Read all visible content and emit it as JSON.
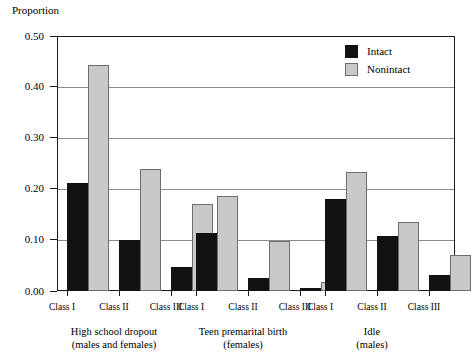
{
  "chart_data": {
    "type": "bar",
    "title": "",
    "xlabel": "",
    "ylabel": "Proportion",
    "ylim": [
      0.0,
      0.5
    ],
    "yticks": [
      "0.00",
      "0.10",
      "0.20",
      "0.30",
      "0.40",
      "0.50"
    ],
    "ytick_values": [
      0.0,
      0.1,
      0.2,
      0.3,
      0.4,
      0.5
    ],
    "grid": true,
    "legend_position": "top-right",
    "legend": [
      "Intact",
      "Nonintact"
    ],
    "categories": [
      "Class I",
      "Class II",
      "Class III"
    ],
    "groups": [
      {
        "caption_line1": "High school dropout",
        "caption_line2": "(males and females)",
        "categories": [
          "Class I",
          "Class II",
          "Class III"
        ],
        "series": [
          {
            "name": "Intact",
            "values": [
              0.211,
              0.101,
              0.048
            ]
          },
          {
            "name": "Nonintact",
            "values": [
              0.444,
              0.239,
              0.17
            ]
          }
        ]
      },
      {
        "caption_line1": "Teen premarital birth",
        "caption_line2": "(females)",
        "categories": [
          "Class I",
          "Class II",
          "Class III"
        ],
        "series": [
          {
            "name": "Intact",
            "values": [
              0.113,
              0.025,
              0.005
            ]
          },
          {
            "name": "Nonintact",
            "values": [
              0.186,
              0.099,
              0.017
            ]
          }
        ]
      },
      {
        "caption_line1": "Idle",
        "caption_line2": "(males)",
        "categories": [
          "Class I",
          "Class II",
          "Class III"
        ],
        "series": [
          {
            "name": "Intact",
            "values": [
              0.18,
              0.107,
              0.031
            ]
          },
          {
            "name": "Nonintact",
            "values": [
              0.233,
              0.135,
              0.071
            ]
          }
        ]
      }
    ],
    "colors": {
      "intact": "#111111",
      "nonintact": "#c9c9c9",
      "nonintact_border": "#6e6e6e",
      "axis": "#1a1a1a",
      "grid": "#8c8c8c",
      "background": "#ffffff"
    }
  }
}
